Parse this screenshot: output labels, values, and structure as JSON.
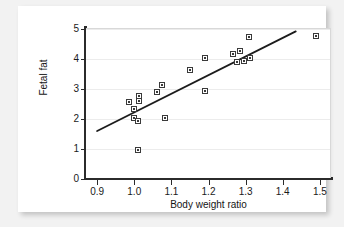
{
  "chart_data": {
    "type": "scatter",
    "title": "",
    "xlabel": "Body weight ratio",
    "ylabel": "Fetal fat",
    "xlim": [
      0.87,
      1.53
    ],
    "ylim": [
      0,
      5
    ],
    "xticks": [
      0.9,
      1.0,
      1.1,
      1.2,
      1.3,
      1.4,
      1.5
    ],
    "xtick_labels": [
      "0.9",
      "1.0",
      "1.1",
      "1.2",
      "1.3",
      "1.4",
      "1.5"
    ],
    "yticks": [
      0,
      1,
      2,
      3,
      4,
      5
    ],
    "ytick_labels": [
      "0",
      "1",
      "2",
      "3",
      "4",
      "5"
    ],
    "grid": "horizontal",
    "legend": "none",
    "marker_style": "open-square-with-center-dot",
    "points": [
      {
        "x": 0.986,
        "y": 2.57
      },
      {
        "x": 0.998,
        "y": 2.32
      },
      {
        "x": 0.998,
        "y": 2.05
      },
      {
        "x": 1.012,
        "y": 2.78
      },
      {
        "x": 1.012,
        "y": 2.6
      },
      {
        "x": 1.01,
        "y": 1.92
      },
      {
        "x": 1.01,
        "y": 0.97
      },
      {
        "x": 1.062,
        "y": 2.9
      },
      {
        "x": 1.076,
        "y": 3.15
      },
      {
        "x": 1.083,
        "y": 2.05
      },
      {
        "x": 1.15,
        "y": 3.62
      },
      {
        "x": 1.19,
        "y": 4.05
      },
      {
        "x": 1.19,
        "y": 2.92
      },
      {
        "x": 1.265,
        "y": 4.18
      },
      {
        "x": 1.285,
        "y": 4.28
      },
      {
        "x": 1.277,
        "y": 3.9
      },
      {
        "x": 1.295,
        "y": 3.92
      },
      {
        "x": 1.31,
        "y": 4.75
      },
      {
        "x": 1.313,
        "y": 4.02
      },
      {
        "x": 1.49,
        "y": 4.78
      }
    ],
    "fit_line": {
      "type": "linear-regression",
      "x_start": 0.9,
      "y_start": 1.6,
      "x_end": 1.435,
      "y_end": 4.92
    }
  }
}
